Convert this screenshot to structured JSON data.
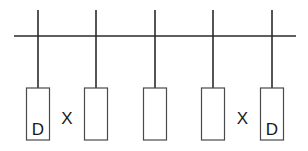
{
  "diagram": {
    "type": "bus-with-drops",
    "drop_count": 5,
    "drops": [
      {
        "id": 1,
        "label": "D"
      },
      {
        "id": 2,
        "label": ""
      },
      {
        "id": 3,
        "label": ""
      },
      {
        "id": 4,
        "label": ""
      },
      {
        "id": 5,
        "label": "D"
      }
    ],
    "gap_marks": [
      {
        "between": [
          1,
          2
        ],
        "label": "X"
      },
      {
        "between": [
          4,
          5
        ],
        "label": "X"
      }
    ]
  }
}
